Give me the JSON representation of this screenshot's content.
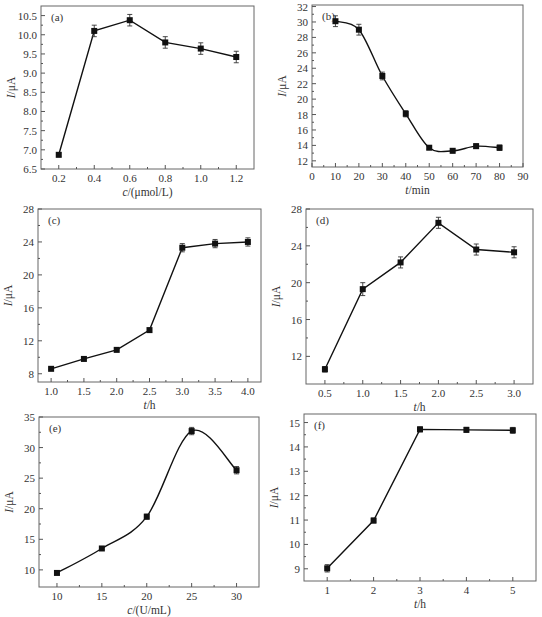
{
  "figure": {
    "width": 542,
    "height": 617,
    "colors": {
      "line": "#111111",
      "marker": "#111111",
      "frame": "#666666",
      "text": "#333333"
    }
  },
  "chart_data": [
    {
      "id": "a",
      "panel_label": "(a)",
      "type": "line",
      "smooth": false,
      "xlabel": "c/(μmol/L)",
      "xlabel_italic": "c",
      "xlabel_rest": "/(μmol/L)",
      "ylabel": "I/μA",
      "x": [
        0.2,
        0.4,
        0.6,
        0.8,
        1.0,
        1.2
      ],
      "values": [
        6.87,
        10.1,
        10.38,
        9.8,
        9.64,
        9.42
      ],
      "errors": [
        0.05,
        0.15,
        0.15,
        0.15,
        0.15,
        0.15
      ],
      "xlim": [
        0.1,
        1.3
      ],
      "ylim": [
        6.5,
        10.75
      ],
      "xticks": [
        0.2,
        0.4,
        0.6,
        0.8,
        1.0,
        1.2
      ],
      "xtick_labels": [
        "0.2",
        "0.4",
        "0.6",
        "0.8",
        "1.0",
        "1.2"
      ],
      "yticks": [
        6.5,
        7.0,
        7.5,
        8.0,
        8.5,
        9.0,
        9.5,
        10.0,
        10.5
      ],
      "ytick_labels": [
        "6.5",
        "7.0",
        "7.5",
        "8.0",
        "8.5",
        "9.0",
        "9.5",
        "10.0",
        "10.5"
      ],
      "box": {
        "x": 41,
        "y": 6,
        "w": 213,
        "h": 163
      }
    },
    {
      "id": "b",
      "panel_label": "(b)",
      "type": "line",
      "smooth": true,
      "xlabel": "t/min",
      "xlabel_italic": "t",
      "xlabel_rest": "/min",
      "ylabel": "I/μA",
      "x": [
        10,
        20,
        30,
        40,
        50,
        60,
        70,
        80
      ],
      "values": [
        30.1,
        29.0,
        23.0,
        18.1,
        13.7,
        13.3,
        13.9,
        13.7
      ],
      "errors": [
        0.7,
        0.7,
        0.5,
        0.4,
        0.2,
        0.25,
        0.3,
        0.35
      ],
      "xlim": [
        0,
        90
      ],
      "ylim": [
        11.2,
        32.2
      ],
      "xticks": [
        0,
        10,
        20,
        30,
        40,
        50,
        60,
        70,
        80,
        90
      ],
      "xtick_labels": [
        "0",
        "10",
        "20",
        "30",
        "40",
        "50",
        "60",
        "70",
        "80",
        "90"
      ],
      "yticks": [
        12,
        14,
        16,
        18,
        20,
        22,
        24,
        26,
        28,
        30,
        32
      ],
      "ytick_labels": [
        "12",
        "14",
        "16",
        "18",
        "20",
        "22",
        "24",
        "26",
        "28",
        "30",
        "32"
      ],
      "box": {
        "x": 312,
        "y": 5,
        "w": 211,
        "h": 162
      }
    },
    {
      "id": "c",
      "panel_label": "(c)",
      "type": "line",
      "smooth": false,
      "xlabel": "t/h",
      "xlabel_italic": "t",
      "xlabel_rest": "/h",
      "ylabel": "I/μA",
      "x": [
        1.0,
        1.5,
        2.0,
        2.5,
        3.0,
        3.5,
        4.0
      ],
      "values": [
        8.6,
        9.8,
        10.9,
        13.3,
        23.3,
        23.8,
        24.0
      ],
      "errors": [
        0.1,
        0.1,
        0.1,
        0.15,
        0.5,
        0.5,
        0.5
      ],
      "xlim": [
        0.8,
        4.2
      ],
      "ylim": [
        7.0,
        28.0
      ],
      "xticks": [
        1.0,
        1.5,
        2.0,
        2.5,
        3.0,
        3.5,
        4.0
      ],
      "xtick_labels": [
        "1.0",
        "1.5",
        "2.0",
        "2.5",
        "3.0",
        "3.5",
        "4.0"
      ],
      "yticks": [
        8,
        12,
        16,
        20,
        24,
        28
      ],
      "ytick_labels": [
        "8",
        "12",
        "16",
        "20",
        "24",
        "28"
      ],
      "box": {
        "x": 38,
        "y": 209,
        "w": 223,
        "h": 173
      }
    },
    {
      "id": "d",
      "panel_label": "(d)",
      "type": "line",
      "smooth": false,
      "xlabel": "t/h",
      "xlabel_italic": "t",
      "xlabel_rest": "/h",
      "ylabel": "I/μA",
      "x": [
        0.5,
        1.0,
        1.5,
        2.0,
        2.5,
        3.0
      ],
      "values": [
        10.6,
        19.3,
        22.2,
        26.5,
        23.6,
        23.3
      ],
      "errors": [
        0.3,
        0.7,
        0.6,
        0.6,
        0.6,
        0.6
      ],
      "xlim": [
        0.25,
        3.25
      ],
      "ylim": [
        9.0,
        28.0
      ],
      "xticks": [
        0.5,
        1.0,
        1.5,
        2.0,
        2.5,
        3.0
      ],
      "xtick_labels": [
        "0.5",
        "1.0",
        "1.5",
        "2.0",
        "2.5",
        "3.0"
      ],
      "yticks": [
        12,
        16,
        20,
        24,
        28
      ],
      "ytick_labels": [
        "12",
        "16",
        "20",
        "24",
        "28"
      ],
      "box": {
        "x": 306,
        "y": 209,
        "w": 227,
        "h": 175
      }
    },
    {
      "id": "e",
      "panel_label": "(e)",
      "type": "line",
      "smooth": true,
      "xlabel": "c/(U/mL)",
      "xlabel_italic": "c",
      "xlabel_rest": "/(U/mL)",
      "ylabel": "I/μA",
      "x": [
        10,
        15,
        20,
        25,
        30
      ],
      "values": [
        9.5,
        13.5,
        18.7,
        32.7,
        26.3
      ],
      "errors": [
        0.2,
        0.2,
        0.4,
        0.6,
        0.6
      ],
      "xlim": [
        8,
        32.5
      ],
      "ylim": [
        7.2,
        35.0
      ],
      "xticks": [
        10,
        15,
        20,
        25,
        30
      ],
      "xtick_labels": [
        "10",
        "15",
        "20",
        "25",
        "30"
      ],
      "yticks": [
        10,
        15,
        20,
        25,
        30,
        35
      ],
      "ytick_labels": [
        "10",
        "15",
        "20",
        "25",
        "30",
        "35"
      ],
      "box": {
        "x": 39,
        "y": 417,
        "w": 220,
        "h": 170
      }
    },
    {
      "id": "f",
      "panel_label": "(f)",
      "type": "line",
      "smooth": false,
      "xlabel": "t/h",
      "xlabel_italic": "t",
      "xlabel_rest": "/h",
      "ylabel": "I/μA",
      "x": [
        1,
        2,
        3,
        4,
        5
      ],
      "values": [
        9.02,
        10.98,
        14.72,
        14.7,
        14.68
      ],
      "errors": [
        0.15,
        0.1,
        0.1,
        0.1,
        0.12
      ],
      "xlim": [
        0.5,
        5.5
      ],
      "ylim": [
        8.5,
        15.35
      ],
      "xticks": [
        1,
        2,
        3,
        4,
        5
      ],
      "xtick_labels": [
        "1",
        "2",
        "3",
        "4",
        "5"
      ],
      "yticks": [
        9,
        10,
        11,
        12,
        13,
        14,
        15
      ],
      "ytick_labels": [
        "9",
        "10",
        "11",
        "12",
        "13",
        "14",
        "15"
      ],
      "box": {
        "x": 304,
        "y": 414,
        "w": 232,
        "h": 167
      }
    }
  ]
}
